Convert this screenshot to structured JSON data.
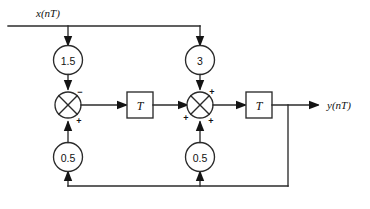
{
  "diagram": {
    "type": "signal-flow-block-diagram",
    "colors": {
      "line": "#2b2b2b",
      "arrow": "#141414",
      "background": "#ffffff",
      "text": "#111111"
    },
    "input": {
      "label": "x(nT)"
    },
    "output": {
      "label": "y(nT)"
    },
    "gains": {
      "forward_left": "1.5",
      "forward_right": "3",
      "feedback_left": "0.5",
      "feedback_right": "0.5"
    },
    "delays": {
      "left": "T",
      "right": "T"
    },
    "adders": {
      "left": {
        "name": "summing-junction-left",
        "signs": {
          "top": "−",
          "bottom": "+"
        }
      },
      "right": {
        "name": "summing-junction-right",
        "signs": {
          "top": "+",
          "left": "+",
          "bottom": "+"
        }
      }
    }
  }
}
